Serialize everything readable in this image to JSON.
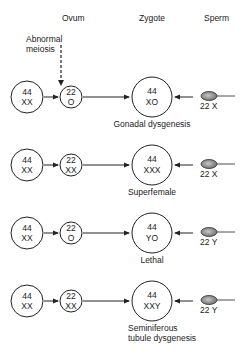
{
  "headers": {
    "ovum": "Ovum",
    "zygote": "Zygote",
    "sperm": "Sperm"
  },
  "annotation": {
    "line1": "Abnormal",
    "line2": "meiosis"
  },
  "rows": [
    {
      "parent": {
        "top": "44",
        "bottom": "XX"
      },
      "ovum": {
        "top": "22",
        "bottom": "O"
      },
      "zygote": {
        "top": "44",
        "bottom": "XO"
      },
      "sperm": "22 X",
      "outcome": [
        "Gonadal dysgenesis"
      ]
    },
    {
      "parent": {
        "top": "44",
        "bottom": "XX"
      },
      "ovum": {
        "top": "22",
        "bottom": "XX"
      },
      "zygote": {
        "top": "44",
        "bottom": "XXX"
      },
      "sperm": "22 X",
      "outcome": [
        "Superfemale"
      ]
    },
    {
      "parent": {
        "top": "44",
        "bottom": "XX"
      },
      "ovum": {
        "top": "22",
        "bottom": "O"
      },
      "zygote": {
        "top": "44",
        "bottom": "YO"
      },
      "sperm": "22 Y",
      "outcome": [
        "Lethal"
      ]
    },
    {
      "parent": {
        "top": "44",
        "bottom": "XX"
      },
      "ovum": {
        "top": "22",
        "bottom": "XX"
      },
      "zygote": {
        "top": "44",
        "bottom": "XXY"
      },
      "sperm": "22 Y",
      "outcome": [
        "Seminiferous",
        "tubule dysgenesis"
      ]
    }
  ],
  "colors": {
    "line": "#222222",
    "sperm_fill": "#9a9a9a"
  }
}
